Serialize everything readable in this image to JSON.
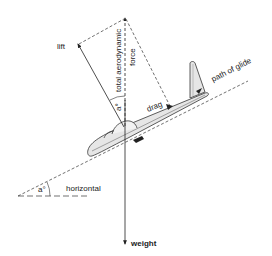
{
  "diagram": {
    "labels": {
      "lift": "lift",
      "total_aerodynamic_force_line1": "total aerodynamic",
      "total_aerodynamic_force_line2": "force",
      "drag": "drag",
      "path_of_glide": "path of glide",
      "horizontal": "horizontal",
      "weight": "weight",
      "angle_glide": "a°",
      "angle_force": "a°"
    },
    "colors": {
      "line": "#222222",
      "glider_fill": "#e6e6e6",
      "glider_stroke": "#333333",
      "background": "#ffffff"
    }
  }
}
